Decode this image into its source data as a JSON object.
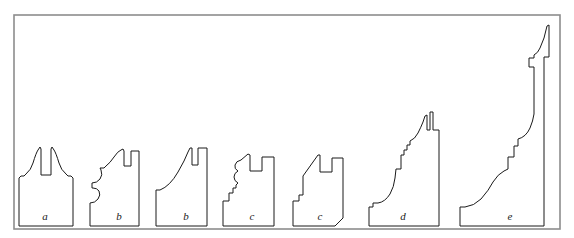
{
  "figure": {
    "background_color": "#ffffff",
    "frame": {
      "name": "figure-border",
      "stroke_color": "#8d8d8d",
      "x": 14,
      "y": 15,
      "width": 546,
      "height": 214
    },
    "line_color": "#1a1a1a",
    "fill_color": "#ffffff",
    "baseline_y": 226,
    "profiles": [
      {
        "label": "a",
        "label_x": 45,
        "label_y": 220,
        "left": 18,
        "right": 72,
        "top": 145,
        "height_px": 81,
        "description": "symmetric twin-horn profile with central slot and ogee flanks",
        "path": "M 19 226 L 19 178 L 21 176 L 24 176 L 26 174 Q 31 170 33 163 Q 36 153 38 150 L 40 147 L 41 149 L 41 175 L 51 175 L 51 149 L 52 147 L 54 150 Q 56 153 59 163 Q 61 170 66 174 L 68 176 L 71 176 L 73 178 L 73 226 Z"
      },
      {
        "label": "b",
        "label_x": 119,
        "label_y": 220,
        "left": 89,
        "right": 140,
        "top": 148,
        "height_px": 78,
        "description": "ogee profile with double scotia and rectangular slot near top right",
        "path": "M 90 226 L 90 203 Q 95 203 98 199 Q 101 195 99 191 Q 97 188 93 188 L 92 188 L 92 183 Q 97 183 100 179 Q 103 175 101 170 L 100 168 L 104 168 L 106 166 Q 110 163 114 157 Q 118 151 121 150 L 123 149 L 124 151 L 124 166 L 131 166 L 131 151 L 139 151 L 139 226 Z"
      },
      {
        "label": "b",
        "label_x": 186,
        "label_y": 220,
        "left": 155,
        "right": 208,
        "top": 147,
        "height_px": 79,
        "description": "long sweeping cavetto profile rising to twin rectangular tenons",
        "path": "M 156 226 L 156 190 L 160 190 Q 170 186 178 172 Q 185 160 188 152 L 190 148 L 192 148 L 192 165 L 198 165 L 198 148 L 207 148 L 207 226 Z"
      },
      {
        "label": "c",
        "label_x": 252,
        "label_y": 220,
        "left": 222,
        "right": 275,
        "top": 153,
        "height_px": 73,
        "description": "stepped base with wavy ogee rising to notched top",
        "path": "M 223 226 L 223 201 L 229 201 L 229 193 L 233 193 L 233 188 L 236 188 L 236 185 L 238 183 Q 234 181 234 177 Q 234 173 238 171 Q 234 169 235 165 Q 236 161 241 160 L 248 154 L 250 155 L 250 171 L 262 171 L 262 157 L 274 157 L 274 226 Z"
      },
      {
        "label": "c",
        "label_x": 320,
        "label_y": 220,
        "left": 292,
        "right": 344,
        "top": 153,
        "height_px": 73,
        "description": "angular variant of c with chamfered lower right corner",
        "path": "M 293 226 L 293 201 L 299 201 L 299 195 L 303 195 L 303 176 L 318 155 L 320 155 L 320 172 L 332 172 L 332 158 L 343 158 L 343 218 L 335 226 Z"
      },
      {
        "label": "d",
        "label_x": 403,
        "label_y": 220,
        "left": 368,
        "right": 440,
        "top": 110,
        "height_px": 116,
        "description": "tall stepped cyma profile with lower cove and upper crenellated top",
        "path": "M 369 226 L 369 207 L 373 207 L 373 203 L 377 203 L 378 203 Q 385 202 390 194 Q 394 187 395 178 L 396 169 L 401 169 L 401 155 L 404 155 L 404 150 L 407 150 L 407 145 L 410 145 L 410 141 Q 415 139 418 133 Q 421 127 423 122 L 425 116 L 427 115 L 427 130 L 430 130 L 430 112 L 433 112 L 433 130 L 439 130 L 439 226 Z"
      },
      {
        "label": "e",
        "label_x": 510,
        "label_y": 220,
        "left": 459,
        "right": 545,
        "top": 24,
        "height_px": 202,
        "description": "tallest profile: large cyma recta base rising through stepped cove to ovolo crown",
        "path": "M 460 226 L 460 207 L 465 207 Q 474 206 481 199 Q 489 190 493 182 Q 498 174 504 171 L 508 169 L 508 157 L 514 157 L 514 146 L 518 146 L 518 139 Q 526 137 530 128 Q 533 121 534 114 L 534 67 L 529 67 L 529 58 L 534 58 L 534 55 Q 538 53 540 48 Q 542 43 544 38 L 547 26 L 549 25 L 549 57 L 544 57 L 544 226 Z"
      }
    ]
  }
}
